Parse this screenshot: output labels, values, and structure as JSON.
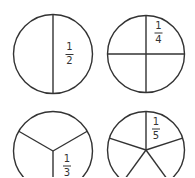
{
  "diagram": {
    "colors": {
      "stroke": "#333333",
      "background": "#ffffff"
    },
    "circles": [
      {
        "name": "halves",
        "parts": 2,
        "numerator": "1",
        "denominator": "2",
        "cx": 53,
        "cy": 54,
        "r": 39.5
      },
      {
        "name": "quarters",
        "parts": 4,
        "numerator": "1",
        "denominator": "4",
        "cx": 146,
        "cy": 54,
        "r": 38.5
      },
      {
        "name": "thirds",
        "parts": 3,
        "numerator": "1",
        "denominator": "3",
        "cx": 53,
        "cy": 151,
        "r": 39.5
      },
      {
        "name": "fifths",
        "parts": 5,
        "numerator": "1",
        "denominator": "5",
        "cx": 146,
        "cy": 150,
        "r": 38.5
      }
    ]
  }
}
